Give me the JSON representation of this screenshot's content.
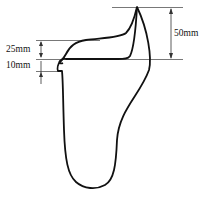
{
  "diagram": {
    "dimensions": [
      {
        "label": "25mm",
        "meaning": "height-step-upper"
      },
      {
        "label": "10mm",
        "meaning": "height-step-lower"
      },
      {
        "label": "50mm",
        "meaning": "total-height"
      }
    ],
    "colors": {
      "stroke": "#111111",
      "guide": "#555555",
      "background": "#ffffff"
    }
  }
}
